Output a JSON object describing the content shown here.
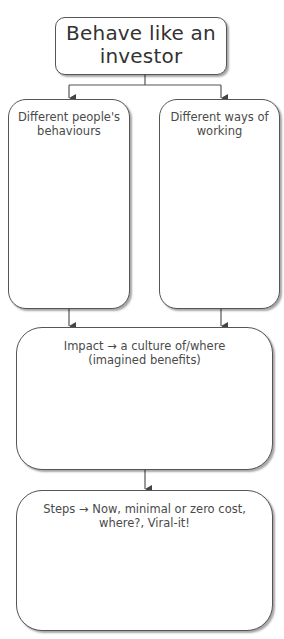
{
  "diagram": {
    "title": "Behave like an investor",
    "title_lines": [
      "Behave like an",
      "investor"
    ],
    "branches": [
      {
        "id": "people",
        "label": "Different people's\nbehaviours"
      },
      {
        "id": "working",
        "label": "Different ways of\nworking"
      }
    ],
    "impact": {
      "label": "Impact → a culture of/where\n(imagined benefits)"
    },
    "steps": {
      "label": "Steps → Now, minimal or zero cost,\nwhere?, Viral-it!"
    },
    "colors": {
      "line": "#555555",
      "box_fill": "#ffffff",
      "text": "#4a4a4a"
    }
  }
}
